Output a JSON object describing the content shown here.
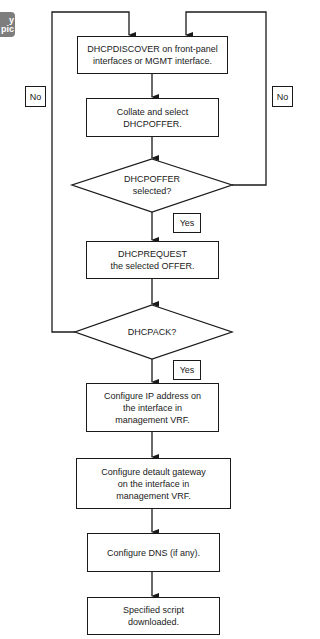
{
  "badge": {
    "line1": "y",
    "line2": "pic"
  },
  "flowchart": {
    "steps": [
      {
        "id": "discover",
        "text": "DHCPDISCOVER on front-panel\ninterfaces or MGMT interface."
      },
      {
        "id": "collate",
        "text": "Collate and select\nDHCPOFFER."
      },
      {
        "id": "offer-decision",
        "text": "DHCPOFFER\nselected?",
        "type": "decision"
      },
      {
        "id": "request",
        "text": "DHCPREQUEST\nthe selected OFFER."
      },
      {
        "id": "ack-decision",
        "text": "DHCPACK?",
        "type": "decision"
      },
      {
        "id": "configure-ip",
        "text": "Configure IP address on\nthe interface in\nmanagement VRF."
      },
      {
        "id": "configure-gateway",
        "text": "Configure detault gateway\non the interface in\nmanagement VRF."
      },
      {
        "id": "configure-dns",
        "text": "Configure DNS (if any)."
      },
      {
        "id": "script-downloaded",
        "text": "Specified script\ndownloaded."
      }
    ],
    "labels": {
      "no_left": "No",
      "no_right": "No",
      "yes_offer": "Yes",
      "yes_ack": "Yes"
    }
  }
}
